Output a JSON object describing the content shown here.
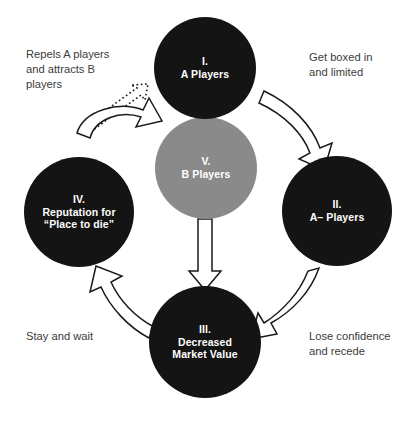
{
  "diagram": {
    "background_color": "#ffffff",
    "node_fill_dark": "#141414",
    "node_fill_gray": "#8a8a8a",
    "node_text_color": "#ffffff",
    "caption_text_color": "#3b3b3b",
    "arrow_fill": "#ffffff",
    "arrow_stroke": "#1a1a1a"
  },
  "nodes": [
    {
      "id": "node-i",
      "numeral": "I.",
      "label": "A Players",
      "text": "I.\nA Players",
      "fill": "#141414"
    },
    {
      "id": "node-ii",
      "numeral": "II.",
      "label": "A– Players",
      "text": "II.\nA– Players",
      "fill": "#141414"
    },
    {
      "id": "node-iii",
      "numeral": "III.",
      "label": "Decreased Market Value",
      "text": "III.\nDecreased\nMarket Value",
      "fill": "#141414"
    },
    {
      "id": "node-iv",
      "numeral": "IV.",
      "label": "Reputation for “Place to die”",
      "text": "IV.\nReputation for\n“Place to die”",
      "fill": "#141414"
    },
    {
      "id": "node-v",
      "numeral": "V.",
      "label": "B Players",
      "text": "V.\nB Players",
      "fill": "#8a8a8a"
    }
  ],
  "captions": [
    {
      "id": "caption-repels",
      "text": "Repels A players\nand attracts B\nplayers",
      "relates_to": "node-iv to node-i"
    },
    {
      "id": "caption-boxed-in",
      "text": "Get boxed in\nand limited",
      "relates_to": "node-i to node-ii"
    },
    {
      "id": "caption-lose-confidence",
      "text": "Lose confidence\nand recede",
      "relates_to": "node-ii to node-iii"
    },
    {
      "id": "caption-stay-and-wait",
      "text": "Stay and wait",
      "relates_to": "node-iii to node-iv"
    }
  ],
  "arrows": [
    {
      "id": "arrow-i-to-ii",
      "style": "solid-curved",
      "from": "node-i",
      "to": "node-ii"
    },
    {
      "id": "arrow-ii-to-iii",
      "style": "solid-curved",
      "from": "node-ii",
      "to": "node-iii"
    },
    {
      "id": "arrow-iii-to-iv",
      "style": "solid-curved",
      "from": "node-iii",
      "to": "node-iv"
    },
    {
      "id": "arrow-iv-to-v",
      "style": "solid-curved",
      "from": "node-iv",
      "to": "node-v"
    },
    {
      "id": "arrow-iv-to-i",
      "style": "dotted",
      "from": "node-iv",
      "to": "node-i"
    },
    {
      "id": "arrow-v-to-iii",
      "style": "solid-straight",
      "from": "node-v",
      "to": "node-iii"
    }
  ]
}
